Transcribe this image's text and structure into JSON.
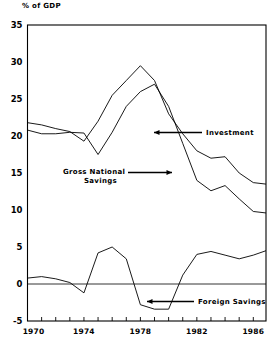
{
  "figure": {
    "unit_title": "% of GDP",
    "background": "#ffffff",
    "ink": "#000000"
  },
  "chart_data": {
    "type": "line",
    "title": "",
    "subtitle": "",
    "xlabel": "",
    "ylabel": "% of GDP",
    "xlim": [
      1970,
      1986.9
    ],
    "ylim": [
      -5,
      35
    ],
    "grid": false,
    "legend": "annotations-inline",
    "y_ticks": [
      35,
      30,
      25,
      20,
      15,
      10,
      5,
      0,
      -5
    ],
    "y_tick_labels": [
      "35",
      "30",
      "25",
      "20",
      "15",
      "10",
      "5",
      "0",
      "-5"
    ],
    "x_ticks": [
      1970,
      1971,
      1972,
      1973,
      1974,
      1975,
      1976,
      1977,
      1978,
      1979,
      1980,
      1981,
      1982,
      1983,
      1984,
      1985,
      1986
    ],
    "x_tick_labels_shown": [
      "1970",
      "1974",
      "1978",
      "1982",
      "1986"
    ],
    "x_tick_labels_shown_at": [
      1970,
      1974,
      1978,
      1982,
      1986
    ],
    "x": [
      1970,
      1971,
      1972,
      1973,
      1974,
      1975,
      1976,
      1977,
      1978,
      1979,
      1980,
      1981,
      1982,
      1983,
      1984,
      1985,
      1986,
      1986.9
    ],
    "series": [
      {
        "name": "Investment",
        "values": [
          21.8,
          21.5,
          21.0,
          20.6,
          19.3,
          22.0,
          25.5,
          27.5,
          29.5,
          27.5,
          23.0,
          20.3,
          18.0,
          17.0,
          17.2,
          15.0,
          13.7,
          13.5
        ]
      },
      {
        "name": "Gross National Savings",
        "values": [
          20.8,
          20.3,
          20.3,
          20.5,
          20.4,
          17.5,
          20.5,
          24.0,
          26.0,
          27.0,
          24.0,
          19.0,
          14.0,
          12.6,
          13.3,
          11.5,
          9.8,
          9.6
        ]
      },
      {
        "name": "Foreign Savings",
        "values": [
          0.8,
          1.0,
          0.7,
          0.2,
          -1.2,
          4.2,
          5.0,
          3.4,
          -2.8,
          -3.4,
          -3.4,
          1.2,
          4.0,
          4.4,
          3.9,
          3.4,
          3.9,
          4.5
        ]
      }
    ],
    "annotations": [
      {
        "text": "Investment",
        "arrow": "left",
        "target_series": "Investment"
      },
      {
        "text": "Gross National",
        "text2": "Savings",
        "arrow": "right",
        "target_series": "Gross National Savings"
      },
      {
        "text": "Foreign Savings",
        "arrow": "left",
        "target_series": "Foreign Savings"
      }
    ]
  },
  "annotations": {
    "investment": "Investment",
    "gns_line1": "Gross National",
    "gns_line2": "Savings",
    "foreign": "Foreign Savings"
  }
}
